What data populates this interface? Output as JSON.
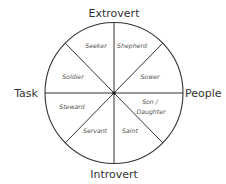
{
  "diagram": {
    "type": "circle-octant-wheel",
    "colors": {
      "line": "#333333",
      "text": "#333333",
      "segment_text": "#555555",
      "background": "#ffffff"
    },
    "axes": {
      "top": "Extrovert",
      "bottom": "Introvert",
      "left": "Task",
      "right": "People"
    },
    "segments": [
      {
        "id": "seeker",
        "label": "Seeker",
        "position": "top-left upper"
      },
      {
        "id": "shepherd",
        "label": "Shepherd",
        "position": "top-right upper"
      },
      {
        "id": "soldier",
        "label": "Soldier",
        "position": "top-left lower"
      },
      {
        "id": "sower",
        "label": "Sower",
        "position": "top-right lower"
      },
      {
        "id": "steward",
        "label": "Steward",
        "position": "bottom-left upper"
      },
      {
        "id": "son-daughter",
        "label_line1": "Son /",
        "label_line2": "Daughter",
        "position": "bottom-right upper"
      },
      {
        "id": "servant",
        "label": "Servant",
        "position": "bottom-left lower"
      },
      {
        "id": "saint",
        "label": "Saint",
        "position": "bottom-right lower"
      }
    ]
  }
}
